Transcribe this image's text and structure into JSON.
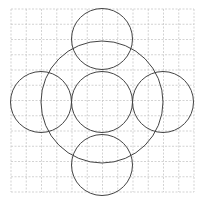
{
  "diagram": {
    "type": "geometric-figure",
    "grid": {
      "origin_x": 11,
      "origin_y": 9,
      "cell_size": 15.25,
      "columns": 12,
      "rows": 12,
      "line_color": "#c8c8c8"
    },
    "stroke_color": "#444444",
    "circles": [
      {
        "name": "large-circle",
        "cx": 102,
        "cy": 102,
        "r": 61
      },
      {
        "name": "center-circle",
        "cx": 102,
        "cy": 102,
        "r": 30.5
      },
      {
        "name": "top-circle",
        "cx": 102,
        "cy": 39,
        "r": 30.5
      },
      {
        "name": "bottom-circle",
        "cx": 102,
        "cy": 165,
        "r": 30.5
      },
      {
        "name": "left-circle",
        "cx": 41,
        "cy": 102,
        "r": 30.5
      },
      {
        "name": "right-circle",
        "cx": 163,
        "cy": 102,
        "r": 30.5
      }
    ]
  }
}
